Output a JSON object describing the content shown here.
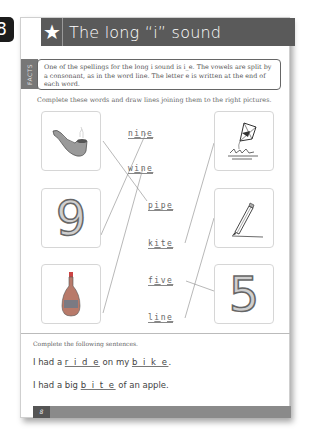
{
  "side_tab": {
    "page_number": "8"
  },
  "header": {
    "icon": "star-icon",
    "title": "The long “i” sound"
  },
  "facts": {
    "tab_label": "FACTS",
    "text": "One of the spellings for the long i sound is i_e. The vowels are split by a consonant, as in the word line. The letter e is written at the end of each word."
  },
  "matching": {
    "instruction": "Complete these words and draw lines joining them to the right pictures.",
    "left_pictures": [
      {
        "name": "pipe-picture",
        "icon": "pipe-icon"
      },
      {
        "name": "nine-picture",
        "icon": "digit-9",
        "glyph": "9"
      },
      {
        "name": "wine-picture",
        "icon": "wine-bottle-icon"
      }
    ],
    "words": [
      {
        "prefix": "n",
        "fill": "i",
        "mid": "n",
        "suffix": "e",
        "word": "nine"
      },
      {
        "prefix": "w",
        "fill": "i",
        "mid": "n",
        "suffix": "e",
        "word": "wine"
      },
      {
        "prefix": "p",
        "fill": "i",
        "mid": "p",
        "suffix": "e",
        "word": "pipe"
      },
      {
        "prefix": "k",
        "fill": "i",
        "mid": "t",
        "suffix": "e",
        "word": "kite"
      },
      {
        "prefix": "f",
        "fill": "i",
        "mid": "v",
        "suffix": "e",
        "word": "five"
      },
      {
        "prefix": "l",
        "fill": "i",
        "mid": "n",
        "suffix": "e",
        "word": "line"
      }
    ],
    "right_pictures": [
      {
        "name": "kite-picture",
        "icon": "kite-icon"
      },
      {
        "name": "line-picture",
        "icon": "pencil-line-icon"
      },
      {
        "name": "five-picture",
        "icon": "digit-5",
        "glyph": "5"
      }
    ]
  },
  "sentences": {
    "instruction": "Complete the following sentences.",
    "items": [
      {
        "parts": [
          "I had a ",
          "r i d e",
          " on my ",
          "b i k e",
          "."
        ]
      },
      {
        "parts": [
          "I had a big ",
          "b i t e",
          " of an apple."
        ]
      }
    ]
  },
  "footer": {
    "page_number": "8"
  }
}
